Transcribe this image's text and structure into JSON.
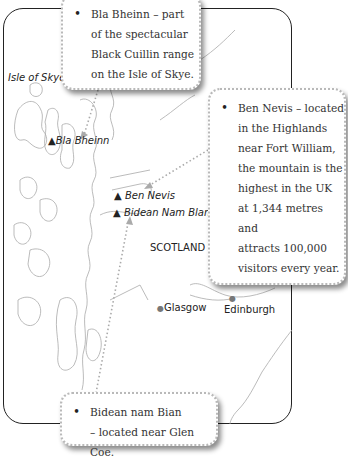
{
  "map": {
    "region_label": "SCOTLAND",
    "island_label": "Isle of Skye",
    "mountains": [
      {
        "name": "Bla Bheinn",
        "marker": "▲"
      },
      {
        "name": "Ben Nevis",
        "marker": "▲"
      },
      {
        "name": "Bidean Nam Blan",
        "marker": "▲"
      }
    ],
    "cities": [
      {
        "name": "Glasgow",
        "marker": "●"
      },
      {
        "name": "Edinburgh",
        "marker": "●"
      }
    ],
    "colors": {
      "frame": "#222222",
      "coast": "#aaaaaa",
      "callout_border": "#b9b9b9",
      "connector": "#aaaaaa"
    }
  },
  "callouts": [
    {
      "id": "bla-bheinn",
      "bullet": "•",
      "text": "Bla Bheinn – part\nof the spectacular\nBlack Cuillin range\non the Isle of Skye."
    },
    {
      "id": "ben-nevis",
      "bullet": "•",
      "text": "Ben Nevis – located\nin the Highlands\nnear Fort William,\nthe mountain is the\nhighest in the UK\nat 1,344 metres and\nattracts 100,000\nvisitors every year."
    },
    {
      "id": "bidean-nam-bian",
      "bullet": "•",
      "text": "Bidean nam Bian\n– located near Glen Coe."
    }
  ]
}
